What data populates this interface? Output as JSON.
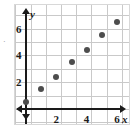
{
  "chart_data": {
    "type": "scatter",
    "title": "",
    "subtitle": "",
    "xlabel": "x",
    "ylabel": "y",
    "xlim": [
      0,
      7.2
    ],
    "ylim": [
      0,
      7.6
    ],
    "grid": true,
    "legend": null,
    "x_ticks": [
      2,
      4,
      6
    ],
    "y_ticks": [
      2,
      4,
      6
    ],
    "x_tick_labels": [
      "2",
      "4",
      "6"
    ],
    "y_tick_labels": [
      "2",
      "4",
      "6"
    ],
    "points": [
      {
        "x": 0,
        "y": 0.5,
        "label": "(0, 0.5)"
      },
      {
        "x": 1,
        "y": 1.5,
        "label": "(1, 1.5)"
      },
      {
        "x": 2,
        "y": 2.4,
        "label": "(2, 2.4)"
      },
      {
        "x": 3,
        "y": 3.5,
        "label": "(3, 3.5)"
      },
      {
        "x": 4,
        "y": 4.4,
        "label": "(4, 4.4)"
      },
      {
        "x": 5,
        "y": 5.5,
        "label": "(5, 5.5)"
      },
      {
        "x": 6,
        "y": 6.5,
        "label": "(6, 6.5)"
      }
    ],
    "colors": {
      "point": "#4d4d4d",
      "axis": "#1a1a1a",
      "grid": "#c9c9c9",
      "background": "#ffffff",
      "frame": "#d8d8d8"
    }
  },
  "marks": {
    "left_edge_artifact": "·"
  }
}
